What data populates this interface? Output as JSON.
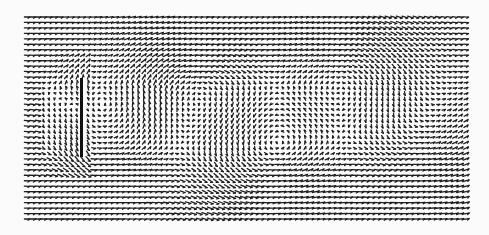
{
  "chart_data": {
    "type": "quiver",
    "title": "",
    "xlabel": "",
    "ylabel": "",
    "description": "Velocity vector field of flow past a vertical flat plate, with a recirculation region behind the plate and alternating vortices downstream",
    "grid": {
      "x_start_px": 27,
      "x_end_px": 466,
      "y_start_px": 17,
      "y_end_px": 219,
      "cols": 80,
      "rows": 38
    },
    "freestream": {
      "u": 1.0,
      "v": 0.0
    },
    "obstacle": {
      "type": "flat-plate",
      "orientation": "vertical",
      "x_px": 81,
      "y_top_px": 78,
      "y_bottom_px": 157,
      "width_px": 3
    },
    "vortices": [
      {
        "x_px": 120,
        "y_px": 110,
        "strength": -1.6,
        "radius_px": 40,
        "label": "recirculation"
      },
      {
        "x_px": 205,
        "y_px": 95,
        "strength": 2.2,
        "radius_px": 55
      },
      {
        "x_px": 265,
        "y_px": 150,
        "strength": -2.4,
        "radius_px": 55
      },
      {
        "x_px": 345,
        "y_px": 75,
        "strength": 2.0,
        "radius_px": 55
      },
      {
        "x_px": 410,
        "y_px": 140,
        "strength": -1.8,
        "radius_px": 55
      }
    ],
    "style": {
      "arrow_color": "#1e1e1e",
      "plate_color": "#111111",
      "background": "#fbfbfb",
      "arrow_scale_px": 5.2,
      "line_width": 1.3
    }
  }
}
